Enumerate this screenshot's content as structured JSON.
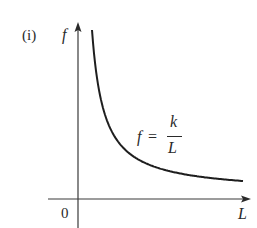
{
  "panel_label": "(i)",
  "chart_data": {
    "type": "line",
    "title": "",
    "xlabel": "L",
    "ylabel": "f",
    "origin_label": "0",
    "equation": {
      "lhs": "f",
      "equals": "=",
      "numerator": "k",
      "denominator": "L"
    },
    "series": [
      {
        "name": "f = k/L",
        "relationship": "inverse proportional",
        "description": "Hyperbola decreasing from high f at small L toward the L-axis as L increases"
      }
    ],
    "grid": false,
    "legend": false,
    "ticks": false
  },
  "colors": {
    "curve": "#1e1e1e",
    "axis": "#3a3a3a",
    "background": "#ffffff"
  },
  "geometry": {
    "axis_x0": 78,
    "axis_y0": 199,
    "x_axis_start": 48,
    "x_axis_end": 251,
    "y_axis_top": 22,
    "y_axis_bottom": 228,
    "curve_x0": 80,
    "curve_ybase": 193,
    "curve_c": 1956,
    "curve_x_start": 92,
    "curve_x_end": 243
  }
}
